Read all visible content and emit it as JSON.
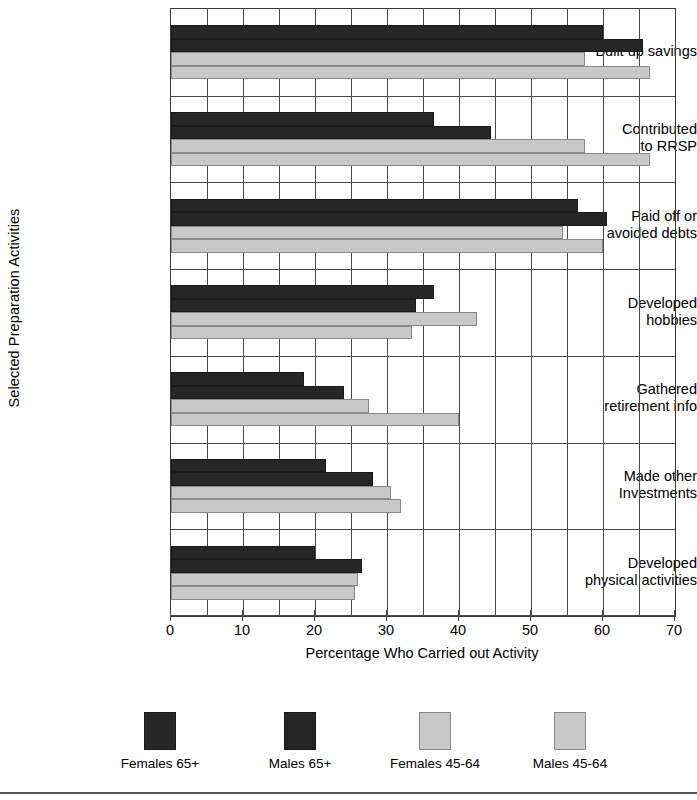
{
  "chart_data": {
    "type": "bar",
    "orientation": "horizontal",
    "title": "",
    "xlabel": "Percentage Who Carried out Activity",
    "ylabel": "Selected Preparation Activities",
    "xlim": [
      0,
      70
    ],
    "xticks": [
      0,
      10,
      20,
      30,
      40,
      50,
      60,
      70
    ],
    "xtick_labels": [
      "0",
      "10",
      "20",
      "30",
      "40",
      "50",
      "60",
      "70"
    ],
    "grid": true,
    "grid_axis": "x",
    "grid_step": 5,
    "legend_position": "bottom",
    "categories": [
      "Built up savings",
      "Contributed to RRSP",
      "Paid off or avoided debts",
      "Developed hobbies",
      "Gathered retirement info",
      "Made other investments",
      "Developed physical activities"
    ],
    "category_lines": [
      [
        "Built up savings"
      ],
      [
        "Contributed",
        "to RRSP"
      ],
      [
        "Paid off or",
        "avoided debts"
      ],
      [
        "Developed",
        "hobbies"
      ],
      [
        "Gathered",
        "retirement info"
      ],
      [
        "Made other",
        "Investments"
      ],
      [
        "Developed",
        "physical activities"
      ]
    ],
    "series": [
      {
        "name": "Females 65+",
        "color": "#262626",
        "values": [
          60.0,
          36.5,
          56.5,
          36.5,
          18.5,
          21.5,
          20.0
        ]
      },
      {
        "name": "Males 65+",
        "color": "#262626",
        "values": [
          65.5,
          44.5,
          60.5,
          34.0,
          24.0,
          28.0,
          26.5
        ]
      },
      {
        "name": "Females 45-64",
        "color": "#c8c8c8",
        "values": [
          57.5,
          57.5,
          54.5,
          42.5,
          27.5,
          30.5,
          26.0
        ]
      },
      {
        "name": "Males 45-64",
        "color": "#c8c8c8",
        "values": [
          66.5,
          66.5,
          60.0,
          33.5,
          40.0,
          32.0,
          25.5
        ]
      }
    ]
  },
  "legend": {
    "items": [
      {
        "label": "Females 65+",
        "swatch": "dark"
      },
      {
        "label": "Males 65+",
        "swatch": "dark"
      },
      {
        "label": "Females 45-64",
        "swatch": "light"
      },
      {
        "label": "Males 45-64",
        "swatch": "light"
      }
    ]
  },
  "colors": {
    "dark_bar": "#262626",
    "light_bar": "#c8c8c8",
    "axis": "#4a4a4a",
    "background": "#ffffff"
  }
}
